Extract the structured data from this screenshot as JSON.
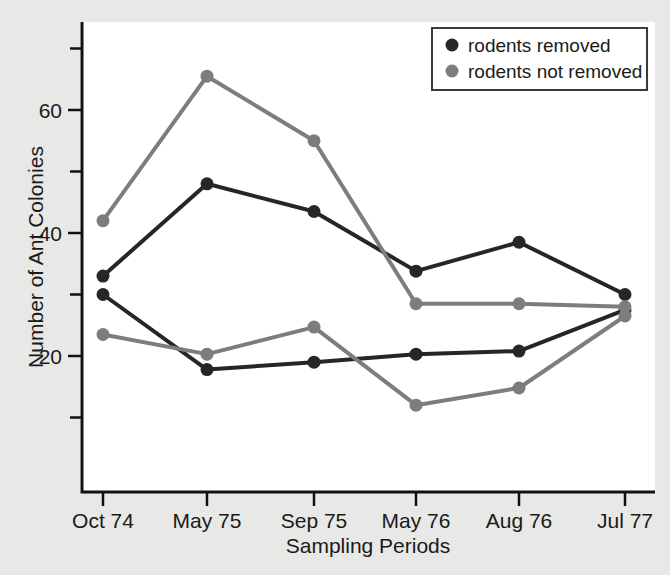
{
  "chart_data": {
    "type": "line",
    "title": "",
    "xlabel": "Sampling Periods",
    "ylabel": "Number of Ant Colonies",
    "categories": [
      "Oct 74",
      "May 75",
      "Sep 75",
      "May 76",
      "Aug 76",
      "Jul 77"
    ],
    "ylim": [
      0,
      72
    ],
    "ytick_labels": [
      "20",
      "40",
      "60"
    ],
    "ytick_values": [
      20,
      40,
      60
    ],
    "yminor_ticks": [
      10,
      30,
      50,
      70
    ],
    "grid": false,
    "legend_position": "top-right",
    "colors": {
      "rodents_removed": "#262626",
      "rodents_not_removed": "#7d7d7d",
      "plot_background": "#ffffff",
      "page_background": "#e8e8e6",
      "axis": "#111111"
    },
    "series": [
      {
        "name": "rodents removed",
        "color": "#262626",
        "values": [
          33,
          48,
          43.5,
          33.8,
          38.5,
          30
        ]
      },
      {
        "name": "rodents removed",
        "color": "#262626",
        "values": [
          30,
          17.8,
          19,
          20.3,
          20.8,
          27.5
        ]
      },
      {
        "name": "rodents not removed",
        "color": "#7d7d7d",
        "values": [
          42,
          65.5,
          55,
          28.5,
          28.5,
          28
        ]
      },
      {
        "name": "rodents not removed",
        "color": "#7d7d7d",
        "values": [
          23.5,
          20.3,
          24.7,
          12,
          14.8,
          26.5
        ]
      }
    ],
    "legend": [
      {
        "label": "rodents removed",
        "marker_color": "#262626"
      },
      {
        "label": "rodents not removed",
        "marker_color": "#7d7d7d"
      }
    ]
  }
}
